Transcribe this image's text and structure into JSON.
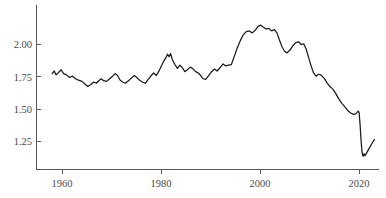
{
  "chart_data": {
    "type": "line",
    "title": "",
    "subtitle": "",
    "xlabel": "",
    "ylabel": "",
    "xlim": [
      1957.5,
      2023.5
    ],
    "ylim": [
      1.08,
      2.22
    ],
    "grid": false,
    "legend": null,
    "xticks": [
      1960,
      1980,
      2000,
      2020
    ],
    "xtick_labels": [
      "1960",
      "1980",
      "2000",
      "2020"
    ],
    "yticks": [
      1.25,
      1.5,
      1.75,
      2.0
    ],
    "ytick_labels": [
      "1.25",
      "1.50",
      "1.75",
      "2.00"
    ],
    "line_color": "#1a1a1a",
    "axis_color": "#5a5a5a",
    "background": "#ffffff",
    "series": [
      {
        "name": "value",
        "x": [
          1958,
          1959,
          1960,
          1961,
          1962,
          1963,
          1964,
          1965,
          1966,
          1967,
          1968,
          1969,
          1970,
          1971,
          1972,
          1973,
          1974,
          1975,
          1976,
          1977,
          1978,
          1979,
          1980,
          1981,
          1982,
          1983,
          1984,
          1985,
          1986,
          1987,
          1988,
          1989,
          1990,
          1991,
          1992,
          1993,
          1994,
          1995,
          1996,
          1997,
          1998,
          1999,
          2000,
          2001,
          2002,
          2003,
          2004,
          2005,
          2006,
          2007,
          2008,
          2009,
          2010,
          2011,
          2012,
          2013,
          2014,
          2015,
          2016,
          2017,
          2018,
          2019,
          2020,
          2021,
          2022,
          2023
        ],
        "y": [
          1.78,
          1.77,
          1.81,
          1.78,
          1.74,
          1.76,
          1.72,
          1.7,
          1.67,
          1.7,
          1.73,
          1.7,
          1.74,
          1.73,
          1.76,
          1.78,
          1.74,
          1.71,
          1.7,
          1.73,
          1.76,
          1.74,
          1.71,
          1.74,
          1.78,
          1.83,
          1.92,
          1.85,
          1.82,
          1.8,
          1.82,
          1.79,
          1.77,
          1.8,
          1.78,
          1.77,
          1.76,
          1.82,
          1.86,
          1.84,
          1.84,
          1.86,
          1.98,
          2.07,
          2.12,
          2.14,
          2.11,
          2.13,
          2.15,
          2.11,
          2.11,
          2.12,
          2.06,
          1.97,
          1.93,
          1.91,
          1.96,
          2.01,
          2.02,
          1.99,
          1.93,
          1.82,
          1.74,
          1.75,
          1.73,
          1.68
        ]
      }
    ],
    "series_path_points": [
      [
        1958,
        1.775
      ],
      [
        1958.4,
        1.795
      ],
      [
        1958.8,
        1.765
      ],
      [
        1959.3,
        1.785
      ],
      [
        1959.8,
        1.805
      ],
      [
        1960.3,
        1.775
      ],
      [
        1960.9,
        1.765
      ],
      [
        1961.5,
        1.745
      ],
      [
        1962.1,
        1.755
      ],
      [
        1962.7,
        1.735
      ],
      [
        1963.3,
        1.725
      ],
      [
        1964.0,
        1.715
      ],
      [
        1964.6,
        1.695
      ],
      [
        1965.2,
        1.675
      ],
      [
        1965.8,
        1.69
      ],
      [
        1966.4,
        1.71
      ],
      [
        1966.9,
        1.7
      ],
      [
        1967.4,
        1.72
      ],
      [
        1967.9,
        1.735
      ],
      [
        1968.4,
        1.72
      ],
      [
        1969.0,
        1.715
      ],
      [
        1969.6,
        1.735
      ],
      [
        1970.2,
        1.755
      ],
      [
        1970.7,
        1.775
      ],
      [
        1971.2,
        1.76
      ],
      [
        1971.7,
        1.725
      ],
      [
        1972.2,
        1.71
      ],
      [
        1972.8,
        1.7
      ],
      [
        1973.4,
        1.72
      ],
      [
        1974.0,
        1.74
      ],
      [
        1974.6,
        1.76
      ],
      [
        1975.1,
        1.745
      ],
      [
        1975.6,
        1.725
      ],
      [
        1976.2,
        1.71
      ],
      [
        1976.8,
        1.7
      ],
      [
        1977.4,
        1.73
      ],
      [
        1978.0,
        1.76
      ],
      [
        1978.5,
        1.78
      ],
      [
        1979.0,
        1.76
      ],
      [
        1979.5,
        1.79
      ],
      [
        1980.0,
        1.83
      ],
      [
        1980.5,
        1.87
      ],
      [
        1981.0,
        1.9
      ],
      [
        1981.3,
        1.925
      ],
      [
        1981.6,
        1.905
      ],
      [
        1981.9,
        1.93
      ],
      [
        1982.3,
        1.88
      ],
      [
        1982.8,
        1.845
      ],
      [
        1983.3,
        1.815
      ],
      [
        1983.8,
        1.84
      ],
      [
        1984.3,
        1.82
      ],
      [
        1984.8,
        1.79
      ],
      [
        1985.3,
        1.805
      ],
      [
        1985.9,
        1.825
      ],
      [
        1986.5,
        1.81
      ],
      [
        1987.0,
        1.79
      ],
      [
        1987.5,
        1.78
      ],
      [
        1988.0,
        1.76
      ],
      [
        1988.5,
        1.735
      ],
      [
        1989.0,
        1.73
      ],
      [
        1989.6,
        1.76
      ],
      [
        1990.2,
        1.79
      ],
      [
        1990.8,
        1.81
      ],
      [
        1991.3,
        1.795
      ],
      [
        1991.9,
        1.82
      ],
      [
        1992.5,
        1.85
      ],
      [
        1993.0,
        1.835
      ],
      [
        1993.6,
        1.84
      ],
      [
        1994.2,
        1.845
      ],
      [
        1994.8,
        1.91
      ],
      [
        1995.4,
        1.975
      ],
      [
        1996.0,
        2.03
      ],
      [
        1996.6,
        2.075
      ],
      [
        1997.2,
        2.1
      ],
      [
        1997.8,
        2.105
      ],
      [
        1998.4,
        2.09
      ],
      [
        1999.0,
        2.11
      ],
      [
        1999.6,
        2.14
      ],
      [
        2000.1,
        2.15
      ],
      [
        2000.6,
        2.135
      ],
      [
        2001.2,
        2.12
      ],
      [
        2001.8,
        2.125
      ],
      [
        2002.3,
        2.105
      ],
      [
        2002.9,
        2.115
      ],
      [
        2003.4,
        2.09
      ],
      [
        2003.9,
        2.035
      ],
      [
        2004.4,
        1.985
      ],
      [
        2004.9,
        1.95
      ],
      [
        2005.4,
        1.935
      ],
      [
        2006.0,
        1.955
      ],
      [
        2006.6,
        1.99
      ],
      [
        2007.2,
        2.015
      ],
      [
        2007.8,
        2.02
      ],
      [
        2008.3,
        2.0
      ],
      [
        2008.8,
        2.005
      ],
      [
        2009.3,
        1.965
      ],
      [
        2009.8,
        1.9
      ],
      [
        2010.3,
        1.835
      ],
      [
        2010.8,
        1.78
      ],
      [
        2011.3,
        1.755
      ],
      [
        2011.8,
        1.77
      ],
      [
        2012.3,
        1.765
      ],
      [
        2012.9,
        1.74
      ],
      [
        2013.5,
        1.705
      ],
      [
        2014.1,
        1.675
      ],
      [
        2014.7,
        1.655
      ],
      [
        2015.3,
        1.62
      ],
      [
        2015.9,
        1.58
      ],
      [
        2016.5,
        1.545
      ],
      [
        2017.1,
        1.52
      ],
      [
        2017.7,
        1.49
      ],
      [
        2018.3,
        1.47
      ],
      [
        2018.9,
        1.46
      ],
      [
        2019.4,
        1.465
      ],
      [
        2019.8,
        1.485
      ],
      [
        2020.0,
        1.475
      ],
      [
        2020.2,
        1.38
      ],
      [
        2020.4,
        1.255
      ],
      [
        2020.6,
        1.165
      ],
      [
        2020.8,
        1.135
      ],
      [
        2021.0,
        1.155
      ],
      [
        2021.2,
        1.14
      ],
      [
        2021.5,
        1.16
      ],
      [
        2022.0,
        1.195
      ],
      [
        2022.6,
        1.235
      ],
      [
        2023.1,
        1.265
      ]
    ]
  },
  "axes": {
    "y_axis_name": "y-axis",
    "x_axis_name": "x-axis"
  }
}
